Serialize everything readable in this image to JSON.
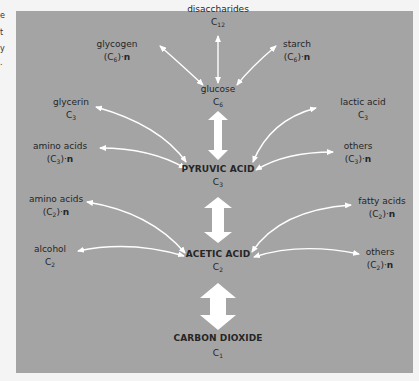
{
  "margin_fragments": [
    "e",
    "t",
    "y",
    "."
  ],
  "diagram": {
    "background": "#a4a4a4",
    "arrow_color": "#ffffff",
    "text_color": "#262626",
    "nodes": {
      "disaccharides": {
        "name": "disaccharides",
        "formula_base": "C",
        "formula_sub": "12",
        "formula_suffix": ""
      },
      "glycogen": {
        "name": "glycogen",
        "formula_base": "(C",
        "formula_sub": "6",
        "formula_suffix": ")·",
        "n": "n"
      },
      "starch": {
        "name": "starch",
        "formula_base": "(C",
        "formula_sub": "6",
        "formula_suffix": ")·",
        "n": "n"
      },
      "glucose": {
        "name": "glucose",
        "formula_base": "C",
        "formula_sub": "6",
        "formula_suffix": ""
      },
      "glycerin": {
        "name": "glycerin",
        "formula_base": "C",
        "formula_sub": "3",
        "formula_suffix": ""
      },
      "lactic_acid": {
        "name": "lactic acid",
        "formula_base": "C",
        "formula_sub": "3",
        "formula_suffix": ""
      },
      "amino_acids_c3": {
        "name": "amino acids",
        "formula_base": "(C",
        "formula_sub": "3",
        "formula_suffix": ")·",
        "n": "n"
      },
      "others_c3": {
        "name": "others",
        "formula_base": "(C",
        "formula_sub": "3",
        "formula_suffix": ")·",
        "n": "n"
      },
      "pyruvic_acid": {
        "name": "PYRUVIC ACID",
        "formula_base": "C",
        "formula_sub": "3",
        "formula_suffix": ""
      },
      "amino_acids_c2": {
        "name": "amino acids",
        "formula_base": "(C",
        "formula_sub": "2",
        "formula_suffix": ")·",
        "n": "n"
      },
      "fatty_acids": {
        "name": "fatty acids",
        "formula_base": "(C",
        "formula_sub": "2",
        "formula_suffix": ")·",
        "n": "n"
      },
      "alcohol": {
        "name": "alcohol",
        "formula_base": "C",
        "formula_sub": "2",
        "formula_suffix": ""
      },
      "acetic_acid": {
        "name": "ACETIC ACID",
        "formula_base": "C",
        "formula_sub": "2",
        "formula_suffix": ""
      },
      "others_c2": {
        "name": "others",
        "formula_base": "(C",
        "formula_sub": "2",
        "formula_suffix": ")·",
        "n": "n"
      },
      "carbon_dioxide": {
        "name": "CARBON DIOXIDE",
        "formula_base": "C",
        "formula_sub": "1",
        "formula_suffix": ""
      }
    },
    "edges": [
      {
        "from": "glucose",
        "to": "disaccharides",
        "type": "thin-bidirectional"
      },
      {
        "from": "glucose",
        "to": "glycogen",
        "type": "thin-bidirectional"
      },
      {
        "from": "glucose",
        "to": "starch",
        "type": "thin-bidirectional"
      },
      {
        "from": "glucose",
        "to": "pyruvic_acid",
        "type": "thick-bidirectional"
      },
      {
        "from": "pyruvic_acid",
        "to": "glycerin",
        "type": "thin-bidirectional"
      },
      {
        "from": "pyruvic_acid",
        "to": "amino_acids_c3",
        "type": "thin-bidirectional"
      },
      {
        "from": "pyruvic_acid",
        "to": "lactic_acid",
        "type": "thin-bidirectional"
      },
      {
        "from": "pyruvic_acid",
        "to": "others_c3",
        "type": "thin-bidirectional"
      },
      {
        "from": "pyruvic_acid",
        "to": "acetic_acid",
        "type": "thick-bidirectional"
      },
      {
        "from": "acetic_acid",
        "to": "amino_acids_c2",
        "type": "thin-bidirectional"
      },
      {
        "from": "acetic_acid",
        "to": "alcohol",
        "type": "thin-bidirectional"
      },
      {
        "from": "acetic_acid",
        "to": "fatty_acids",
        "type": "thin-bidirectional"
      },
      {
        "from": "acetic_acid",
        "to": "others_c2",
        "type": "thin-bidirectional"
      },
      {
        "from": "acetic_acid",
        "to": "carbon_dioxide",
        "type": "thick-bidirectional"
      }
    ]
  }
}
